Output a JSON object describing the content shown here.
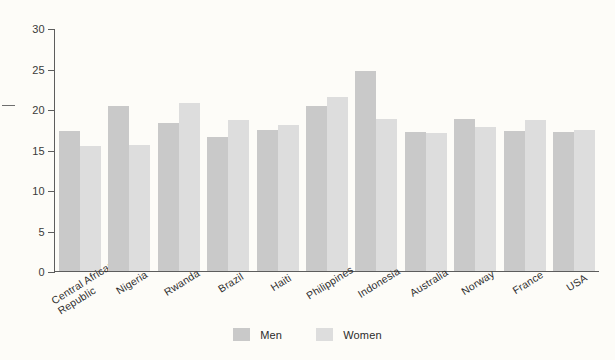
{
  "chart_data": {
    "type": "bar",
    "title": "",
    "subtitle": "",
    "xlabel": "",
    "ylabel": "",
    "ylim": [
      0,
      30
    ],
    "yticks": [
      0,
      5,
      10,
      15,
      20,
      25,
      30
    ],
    "grid": false,
    "legend_position": "bottom",
    "categories": [
      "Central African\nRepublic",
      "Nigeria",
      "Rwanda",
      "Brazil",
      "Haiti",
      "Philippines",
      "Indonesia",
      "Australia",
      "Norway",
      "France",
      "USA"
    ],
    "series": [
      {
        "name": "Men",
        "color": "#c9c9c9",
        "values": [
          17.4,
          20.4,
          18.4,
          16.6,
          17.5,
          20.4,
          24.8,
          17.2,
          18.9,
          17.3,
          17.2
        ]
      },
      {
        "name": "Women",
        "color": "#dddddd",
        "values": [
          15.5,
          15.6,
          20.8,
          18.7,
          18.1,
          21.6,
          18.9,
          17.1,
          17.8,
          18.7,
          17.5
        ]
      }
    ]
  },
  "legend": {
    "items": [
      {
        "label": "Men"
      },
      {
        "label": "Women"
      }
    ]
  },
  "colors": {
    "background": "#fdfcf8",
    "axis": "#5d5d5d",
    "men": "#c9c9c9",
    "women": "#dddddd",
    "text": "#2f2f2f"
  }
}
